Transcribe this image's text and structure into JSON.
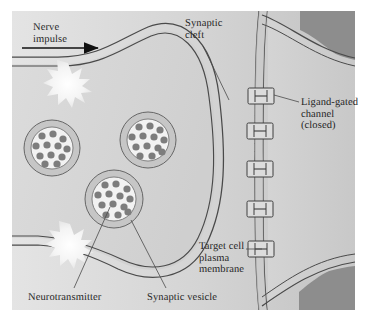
{
  "figure": {
    "width": 369,
    "height": 325
  },
  "labels": {
    "nerve_impulse": "Nerve\nimpulse",
    "synaptic_cleft": "Synaptic\ncleft",
    "ligand_gated_channel": "Ligand-gated\nchannel\n(closed)",
    "target_cell_membrane": "Target cell\nplasma\nmembrane",
    "neurotransmitter": "Neurotransmitter",
    "synaptic_vesicle": "Synaptic vesicle"
  },
  "colors": {
    "page_background": "#ffffff",
    "scene_background": "#d2d2d2",
    "cleft_gradient_light": "#e2e2e2",
    "cleft_gradient_dark": "#c6c6c6",
    "presynaptic_fill": "#d6d6d6",
    "membrane_band": "#c9c9c9",
    "membrane_line": "#4a4a4a",
    "target_cell_fill": "#cfcfcf",
    "outside_dark": "#8a8a8a",
    "vesicle_ring": "#c4c4c4",
    "vesicle_lumen": "#f2f2f2",
    "neurotransmitter_dot": "#7d7d7d",
    "channel_fill": "#dcdcdc",
    "channel_line": "#3f3f3f",
    "starburst": "#f6f6f6",
    "text": "#242424",
    "leader_line": "#4a4a4a",
    "arrow": "#111111"
  },
  "structures": {
    "presynaptic_terminal": {
      "name": "axon terminal",
      "membrane_style": "double-line bilayer"
    },
    "nerve_impulse_arrow": {
      "direction": "left-to-right",
      "x_start": 22,
      "x_end": 100,
      "y": 48
    },
    "starbursts": [
      {
        "name": "action-potential-burst-upper",
        "cx": 68,
        "cy": 82,
        "r": 17,
        "points": 11
      },
      {
        "name": "action-potential-burst-lower",
        "cx": 70,
        "cy": 243,
        "r": 17,
        "points": 11
      }
    ],
    "vesicles": [
      {
        "id": "vesicle-left",
        "cx": 52,
        "cy": 148,
        "r_outer": 28,
        "r_inner": 21,
        "dots": 12
      },
      {
        "id": "vesicle-upper-right",
        "cx": 148,
        "cy": 140,
        "r_outer": 28,
        "r_inner": 21,
        "dots": 13
      },
      {
        "id": "vesicle-lower",
        "cx": 114,
        "cy": 199,
        "r_outer": 29,
        "r_inner": 22,
        "dots": 13
      }
    ],
    "ligand_gated_channels": {
      "count": 5,
      "state": "closed",
      "positions_y": [
        96,
        131,
        169,
        209,
        249
      ],
      "x_center": 261
    },
    "leaders": [
      {
        "name": "leader-synaptic-cleft",
        "from": [
          203,
          44
        ],
        "to": [
          228,
          96
        ]
      },
      {
        "name": "leader-ligand-gated",
        "from": [
          299,
          101
        ],
        "to": [
          272,
          95
        ]
      },
      {
        "name": "leader-target-cell",
        "from": [
          246,
          249
        ],
        "to": [
          262,
          249
        ]
      },
      {
        "name": "leader-neurotransmitter",
        "from": [
          75,
          288
        ],
        "to": [
          110,
          205
        ]
      },
      {
        "name": "leader-synaptic-vesicle",
        "from": [
          166,
          288
        ],
        "to": [
          131,
          216
        ]
      }
    ]
  }
}
